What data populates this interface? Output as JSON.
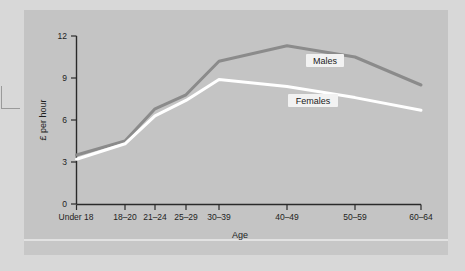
{
  "figure": {
    "background_color": "#d8d8d8",
    "panel_color": "#c4c4c4",
    "separator_color": "#e2e2e2"
  },
  "chart_data": {
    "type": "line",
    "title": "",
    "xlabel": "Age",
    "ylabel": "£ per hour",
    "categories": [
      "Under 18",
      "18–20",
      "21–24",
      "25–29",
      "30–39",
      "40–49",
      "50–59",
      "60–64"
    ],
    "yticks": [
      0,
      3,
      6,
      9,
      12
    ],
    "ylim": [
      0,
      12
    ],
    "grid": false,
    "legend_position": "inline-labels",
    "series": [
      {
        "name": "Males",
        "color": "#8b8b8b",
        "values": [
          3.5,
          4.5,
          6.8,
          7.8,
          10.2,
          11.3,
          10.5,
          8.5
        ]
      },
      {
        "name": "Females",
        "color": "#ffffff",
        "values": [
          3.2,
          4.3,
          6.3,
          7.4,
          8.9,
          8.4,
          7.6,
          6.7
        ]
      }
    ],
    "annotations": [
      {
        "text": "Males",
        "series": "Males"
      },
      {
        "text": "Females",
        "series": "Females"
      }
    ]
  },
  "axis": {
    "y_tick_labels": [
      "12",
      "9",
      "6",
      "3",
      "0"
    ],
    "y_title": "£ per hour",
    "x_title": "Age",
    "x_tick_labels": [
      "Under 18",
      "18–20",
      "21–24",
      "25–29",
      "30–39",
      "40–49",
      "50–59",
      "60–64"
    ]
  },
  "labels": {
    "males": "Males",
    "females": "Females"
  }
}
